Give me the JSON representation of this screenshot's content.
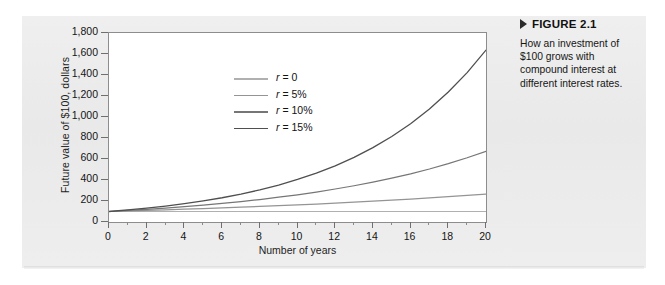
{
  "figure": {
    "marker_icon": "triangle-right-icon",
    "title": "FIGURE 2.1",
    "caption": "How an investment of $100 grows with compound interest at different interest rates."
  },
  "chart_data": {
    "type": "line",
    "title": "",
    "xlabel": "Number of years",
    "ylabel": "Future value of $100, dollars",
    "xlim": [
      0,
      20
    ],
    "ylim": [
      0,
      1800
    ],
    "xticks": [
      0,
      2,
      4,
      6,
      8,
      10,
      12,
      14,
      16,
      18,
      20
    ],
    "xtick_labels": [
      "0",
      "2",
      "4",
      "6",
      "8",
      "10",
      "12",
      "14",
      "16",
      "18",
      "20"
    ],
    "xminor_step": 1,
    "yticks": [
      0,
      200,
      400,
      600,
      800,
      1000,
      1200,
      1400,
      1600,
      1800
    ],
    "ytick_labels": [
      "0",
      "200",
      "400",
      "600",
      "800",
      "1,000",
      "1,200",
      "1,400",
      "1,600",
      "1,800"
    ],
    "grid": false,
    "legend_position": "upper-left-inside",
    "x": [
      0,
      1,
      2,
      3,
      4,
      5,
      6,
      7,
      8,
      9,
      10,
      11,
      12,
      13,
      14,
      15,
      16,
      17,
      18,
      19,
      20
    ],
    "series": [
      {
        "name": "r = 0",
        "rate_label": "0",
        "color": "#b0b0b0",
        "values": [
          100,
          100,
          100,
          100,
          100,
          100,
          100,
          100,
          100,
          100,
          100,
          100,
          100,
          100,
          100,
          100,
          100,
          100,
          100,
          100,
          100
        ]
      },
      {
        "name": "r = 5%",
        "rate_label": "5%",
        "color": "#949494",
        "values": [
          100,
          105,
          110,
          116,
          122,
          128,
          134,
          141,
          148,
          155,
          163,
          171,
          180,
          189,
          198,
          208,
          218,
          229,
          241,
          253,
          265
        ]
      },
      {
        "name": "r = 10%",
        "rate_label": "10%",
        "color": "#767676",
        "values": [
          100,
          110,
          121,
          133,
          146,
          161,
          177,
          195,
          214,
          236,
          259,
          285,
          314,
          345,
          380,
          418,
          459,
          505,
          556,
          612,
          673
        ]
      },
      {
        "name": "r = 15%",
        "rate_label": "15%",
        "color": "#4f4f4f",
        "values": [
          100,
          115,
          132,
          152,
          175,
          201,
          231,
          266,
          306,
          352,
          405,
          465,
          535,
          615,
          708,
          814,
          936,
          1076,
          1238,
          1423,
          1637
        ]
      }
    ]
  }
}
